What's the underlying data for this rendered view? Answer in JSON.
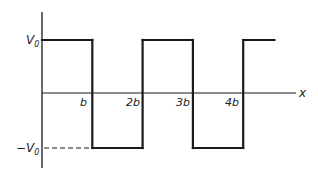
{
  "diagram": {
    "type": "square-wave",
    "axis": {
      "x_label": "x"
    },
    "levels": {
      "high": {
        "label": "V",
        "subscript": "0",
        "value": 1
      },
      "low": {
        "label": "−V",
        "subscript": "0",
        "value": -1
      }
    },
    "ticks": [
      {
        "label": "b",
        "value": 1
      },
      {
        "label": "2b",
        "value": 2
      },
      {
        "label": "3b",
        "value": 3
      },
      {
        "label": "4b",
        "value": 4
      }
    ],
    "waveform": {
      "segments": [
        {
          "from": 0,
          "to": 1,
          "level": 1
        },
        {
          "from": 1,
          "to": 2,
          "level": -1
        },
        {
          "from": 2,
          "to": 3,
          "level": 1
        },
        {
          "from": 3,
          "to": 4,
          "level": -1
        },
        {
          "from": 4,
          "to": 4.62,
          "level": 1
        }
      ]
    },
    "colors": {
      "line": "#1a1a1a",
      "text": "#222222"
    }
  }
}
